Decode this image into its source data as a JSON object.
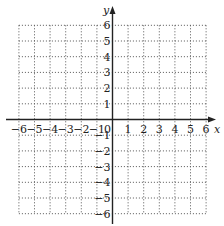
{
  "diagram": {
    "type": "coordinate-grid",
    "x_axis": {
      "label": "x",
      "min": -6,
      "max": 6,
      "ticks": [
        "-6",
        "-5",
        "-4",
        "-3",
        "-2",
        "-1",
        "0",
        "1",
        "2",
        "3",
        "4",
        "5",
        "6"
      ]
    },
    "y_axis": {
      "label": "y",
      "min": -6,
      "max": 6,
      "ticks": [
        "6",
        "5",
        "4",
        "3",
        "2",
        "1",
        "-1",
        "-2",
        "-3",
        "-4",
        "-5",
        "-6"
      ]
    },
    "grid": {
      "style": "dotted",
      "step": 1
    },
    "origin_label": "0",
    "colors": {
      "axis": "#222222",
      "grid": "#555555",
      "background": "#ffffff"
    }
  }
}
